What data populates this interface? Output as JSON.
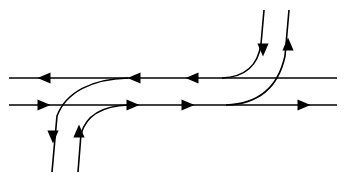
{
  "canvas": {
    "width": 346,
    "height": 182,
    "background": "#ffffff",
    "stroke_color": "#000000",
    "stroke_width": 1.6
  },
  "chart_data": {
    "type": "diagram",
    "title": "",
    "subtitle": "",
    "xlabel": "",
    "ylabel": "",
    "annotations": [],
    "legend": [],
    "grid": false,
    "axis_ranges": {
      "x": [
        0,
        346
      ],
      "y": [
        0,
        182
      ]
    },
    "guides": {
      "upper_line_y": 78,
      "lower_line_y": 105,
      "left_edge_x": 9,
      "right_edge_x": 337
    },
    "elements": [
      {
        "id": "upper-horizontal-line",
        "kind": "line",
        "direction": "leftward",
        "path": "M 337 78 L 9 78",
        "arrows": [
          {
            "x": 44,
            "y": 78,
            "dir": "left"
          },
          {
            "x": 134,
            "y": 78,
            "dir": "left"
          },
          {
            "x": 192,
            "y": 78,
            "dir": "left"
          }
        ]
      },
      {
        "id": "lower-horizontal-line",
        "kind": "line",
        "direction": "rightward",
        "path": "M 9 105 L 337 105",
        "arrows": [
          {
            "x": 44,
            "y": 105,
            "dir": "right"
          },
          {
            "x": 133,
            "y": 105,
            "dir": "right"
          },
          {
            "x": 188,
            "y": 105,
            "dir": "right"
          },
          {
            "x": 304,
            "y": 105,
            "dir": "right"
          }
        ]
      },
      {
        "id": "branch-upper-left-descending",
        "kind": "curve",
        "direction": "downward",
        "path": "M 128 78 C 92 79 66 92 57 116 L 52 172",
        "arrows": [
          {
            "x": 53,
            "y": 137,
            "dir": "down"
          }
        ]
      },
      {
        "id": "branch-lower-left-ascending",
        "kind": "curve",
        "direction": "upward",
        "path": "M 128 105 C 102 106 86 116 81 134 L 78 172",
        "arrows": [
          {
            "x": 79,
            "y": 131,
            "dir": "up"
          }
        ]
      },
      {
        "id": "branch-upper-right-descending",
        "kind": "curve",
        "direction": "downward",
        "path": "M 222 78 C 245 77 258 66 261 44 L 264 10",
        "arrows": [
          {
            "x": 263,
            "y": 50,
            "dir": "down"
          }
        ]
      },
      {
        "id": "branch-lower-right-ascending",
        "kind": "curve",
        "direction": "upward",
        "path": "M 226 105 C 258 104 278 88 285 56 L 289 10",
        "arrows": [
          {
            "x": 288,
            "y": 44,
            "dir": "up"
          }
        ]
      }
    ]
  }
}
